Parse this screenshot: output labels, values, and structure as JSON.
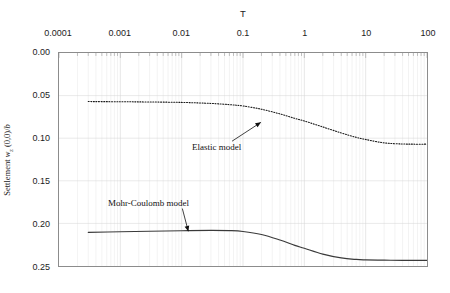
{
  "chart_data": {
    "type": "line",
    "title": "",
    "xlabel": "T",
    "ylabel": "Settlement wz (0,0)/b",
    "xscale": "log",
    "xlim": [
      0.0001,
      100
    ],
    "ylim": [
      0.0,
      0.25
    ],
    "y_inverted": true,
    "grid": true,
    "legend": "none",
    "xticks": [
      "0.0001",
      "0.001",
      "0.01",
      "0.1",
      "1",
      "10",
      "100"
    ],
    "xtick_values": [
      0.0001,
      0.001,
      0.01,
      0.1,
      1,
      10,
      100
    ],
    "yticks": [
      "0.00",
      "0.05",
      "0.10",
      "0.15",
      "0.20",
      "0.25"
    ],
    "ytick_values": [
      0.0,
      0.05,
      0.1,
      0.15,
      0.2,
      0.25
    ],
    "series": [
      {
        "name": "Elastic model",
        "style": "dotted",
        "color": "#1a1a1a",
        "x": [
          0.0003,
          0.001,
          0.003,
          0.01,
          0.03,
          0.06,
          0.1,
          0.2,
          0.4,
          0.7,
          1,
          2,
          4,
          7,
          10,
          20,
          40,
          60,
          100
        ],
        "y": [
          0.057,
          0.0572,
          0.0575,
          0.058,
          0.0592,
          0.0606,
          0.0622,
          0.066,
          0.0715,
          0.0768,
          0.0798,
          0.0868,
          0.0938,
          0.099,
          0.1015,
          0.1055,
          0.1068,
          0.107,
          0.107
        ]
      },
      {
        "name": "Mohr-Coulomb model",
        "style": "solid",
        "color": "#3a3a3a",
        "x": [
          0.0003,
          0.001,
          0.003,
          0.01,
          0.03,
          0.06,
          0.1,
          0.2,
          0.4,
          0.7,
          1,
          2,
          4,
          7,
          10,
          20,
          40,
          60,
          100
        ],
        "y": [
          0.2105,
          0.2098,
          0.2092,
          0.2086,
          0.2082,
          0.2085,
          0.2095,
          0.213,
          0.2195,
          0.2258,
          0.2292,
          0.236,
          0.2405,
          0.2423,
          0.2428,
          0.2432,
          0.2433,
          0.2433,
          0.2433
        ]
      }
    ],
    "annotations": [
      {
        "text": "Elastic model",
        "label_x": 192,
        "label_y": 142,
        "arrow_from": [
          232,
          141
        ],
        "arrow_to": [
          261,
          122
        ]
      },
      {
        "text": "Mohr-Coulomb model",
        "label_x": 108,
        "label_y": 198,
        "arrow_from": [
          182,
          209
        ],
        "arrow_to": [
          188,
          232
        ]
      }
    ]
  }
}
